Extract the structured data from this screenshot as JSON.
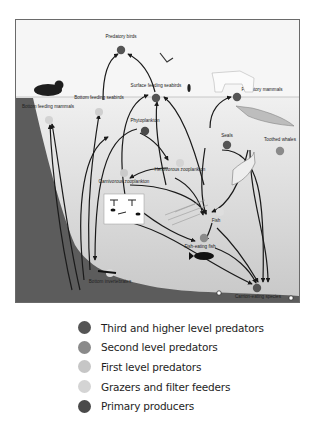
{
  "colors": {
    "third_level": "#555555",
    "second_level": "#8a8a8a",
    "first_level": "#c4c4c4",
    "grazers": "#d6d6d6",
    "primary": "#4a4a4a",
    "sky": "#f4f4f4",
    "water": "#dcdcdc",
    "seafloor": "#5a5a5a",
    "frame": "#6a6a6a",
    "arrow": "#1a1a1a"
  },
  "nodes": {
    "predatory_birds": "Predatory birds",
    "bottom_feeding_seabirds": "Bottom feeding seabirds",
    "surface_feeding_seabirds": "Surface feeding seabirds",
    "predatory_mammals": "Predatory mammals",
    "bottom_feeding_mammals": "Bottom feeding mammals",
    "phytoplankton": "Phytoplankton",
    "seals": "Seals",
    "toothed_whales": "Toothed whales",
    "herbivorous_zooplankton": "Herbivorous zooplankton",
    "carnivorous_zooplankton": "Carnivorous zooplankton",
    "fish": "Fish",
    "fish_eating_fish": "Fish-eating fish",
    "bottom_invertebrates": "Bottom invertebrates",
    "carrion_eating_species": "Carrion-eating species"
  },
  "legend": [
    {
      "label": "Third and higher level predators",
      "color": "#555555"
    },
    {
      "label": "Second level predators",
      "color": "#8a8a8a"
    },
    {
      "label": "First level predators",
      "color": "#c6c6c6"
    },
    {
      "label": "Grazers and filter feeders",
      "color": "#d4d4d4"
    },
    {
      "label": "Primary producers",
      "color": "#4a4a4a"
    }
  ]
}
